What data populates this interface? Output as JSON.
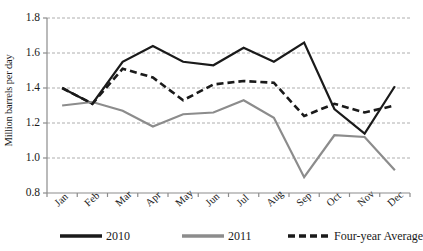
{
  "chart_data": {
    "type": "line",
    "title": "",
    "xlabel": "",
    "ylabel": "Million barrels per day",
    "categories": [
      "Jan",
      "Feb",
      "Mar",
      "Apr",
      "May",
      "Jun",
      "Jul",
      "Aug",
      "Sep",
      "Oct",
      "Nov",
      "Dec"
    ],
    "ylim": [
      0.8,
      1.8
    ],
    "yticks": [
      "1.8",
      "1.6",
      "1.4",
      "1.2",
      "1.0",
      "0.8"
    ],
    "ytick_values": [
      1.8,
      1.6,
      1.4,
      1.2,
      1.0,
      0.8
    ],
    "grid": true,
    "legend_position": "bottom",
    "series": [
      {
        "name": "2010",
        "color": "#1a1a1a",
        "style": "solid",
        "values": [
          1.4,
          1.31,
          1.55,
          1.64,
          1.55,
          1.53,
          1.63,
          1.55,
          1.66,
          1.28,
          1.14,
          1.41
        ]
      },
      {
        "name": "2011",
        "color": "#8c8c8c",
        "style": "solid",
        "values": [
          1.3,
          1.32,
          1.27,
          1.18,
          1.25,
          1.26,
          1.33,
          1.23,
          0.89,
          1.13,
          1.12,
          0.93
        ]
      },
      {
        "name": "Four-year Average",
        "color": "#1a1a1a",
        "style": "dashed",
        "values": [
          1.4,
          1.31,
          1.51,
          1.46,
          1.33,
          1.42,
          1.44,
          1.43,
          1.24,
          1.31,
          1.26,
          1.3
        ]
      }
    ]
  },
  "legend": {
    "items": [
      {
        "label": "2010"
      },
      {
        "label": "2011"
      },
      {
        "label": "Four-year Average"
      }
    ]
  }
}
